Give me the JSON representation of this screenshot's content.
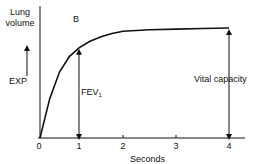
{
  "chart_data": {
    "type": "line",
    "panel_label": "B",
    "ylabel": "Lung volume",
    "y_direction_label": "EXP",
    "xlabel": "Seconds",
    "x_ticks": [
      "0",
      "1",
      "2",
      "3",
      "4"
    ],
    "xlim": [
      0,
      4.3
    ],
    "ylim": [
      0,
      1.0
    ],
    "series": [
      {
        "name": "forced expiration",
        "x": [
          0,
          0.25,
          0.5,
          0.75,
          1,
          1.25,
          1.5,
          1.75,
          2,
          2.5,
          3,
          3.5,
          4
        ],
        "y": [
          0,
          0.36,
          0.6,
          0.74,
          0.82,
          0.88,
          0.92,
          0.95,
          0.97,
          0.985,
          0.99,
          0.995,
          1.0
        ]
      }
    ],
    "annotations": [
      {
        "label": "FEV",
        "subscript": "1",
        "x": 1,
        "y_from": 0,
        "y_to": 0.82
      },
      {
        "label": "Vital capacity",
        "x": 4,
        "y_from": 0,
        "y_to": 1.0
      }
    ]
  }
}
